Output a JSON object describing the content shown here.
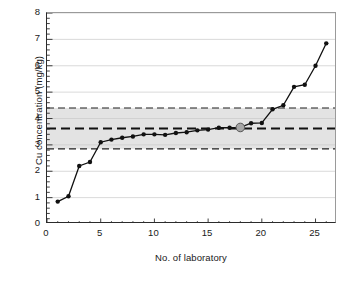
{
  "chart_data": {
    "type": "line",
    "title": "",
    "xlabel": "No. of laboratory",
    "ylabel": "Cu concentration (mg/kg)",
    "xlim": [
      0,
      27
    ],
    "ylim": [
      0,
      8
    ],
    "xticks": [
      0,
      5,
      10,
      15,
      20,
      25
    ],
    "xtick_labels": [
      "0",
      "5",
      "10",
      "15",
      "20",
      "25"
    ],
    "xminor_tick_step": 1,
    "yticks": [
      0,
      1,
      2,
      3,
      4,
      5,
      6,
      7,
      8
    ],
    "ytick_labels": [
      "0",
      "1",
      "2",
      "3",
      "4",
      "5",
      "6",
      "7",
      "8"
    ],
    "yminor_tick_step": 0.2,
    "grid": "horizontal",
    "grid_color": "#c8c8c8",
    "legend": "none",
    "series": [
      {
        "name": "Cu concentration per laboratory",
        "marker": "filled-circle",
        "marker_color": "#111111",
        "line_color": "#111111",
        "x": [
          1,
          2,
          3,
          4,
          5,
          6,
          7,
          8,
          9,
          10,
          11,
          12,
          13,
          14,
          15,
          16,
          17,
          18,
          19,
          20,
          21,
          22,
          23,
          24,
          25,
          26
        ],
        "values": [
          0.85,
          1.05,
          2.2,
          2.35,
          3.1,
          3.2,
          3.27,
          3.32,
          3.4,
          3.4,
          3.38,
          3.45,
          3.48,
          3.55,
          3.58,
          3.65,
          3.65,
          3.66,
          3.82,
          3.83,
          4.35,
          4.5,
          5.2,
          5.28,
          6.0,
          6.85
        ]
      }
    ],
    "highlighted_point": {
      "label": "reporting laboratory",
      "x": 18,
      "y": 3.66,
      "marker": "filled-circle",
      "fill_color": "#a6a6a6",
      "edge_color": "#555555"
    },
    "reference_lines": [
      {
        "name": "upper-tolerance-line",
        "y": 4.4,
        "style": "dashed",
        "color": "#1f1f1f"
      },
      {
        "name": "assigned-value-line",
        "y": 3.62,
        "style": "dashed",
        "color": "#111111",
        "emphasis": "thick"
      },
      {
        "name": "lower-tolerance-line",
        "y": 2.85,
        "style": "dashed",
        "color": "#1f1f1f"
      }
    ],
    "shaded_band": {
      "name": "tolerance-band",
      "y_low": 2.85,
      "y_high": 4.4,
      "fill_color": "#e3e3e3"
    }
  }
}
